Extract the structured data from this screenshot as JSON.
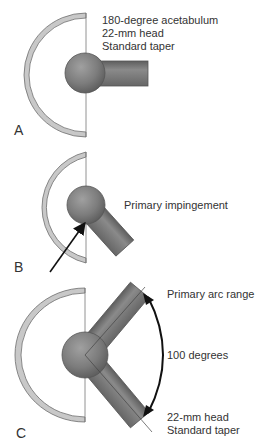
{
  "panels": [
    {
      "letter": "A",
      "labels": [
        "180-degree acetabulum",
        "22-mm head",
        "Standard taper"
      ]
    },
    {
      "letter": "B",
      "labels": [
        "Primary impingement"
      ]
    },
    {
      "letter": "C",
      "labels": [
        "Primary arc range",
        "100 degrees",
        "22-mm head",
        "Standard taper"
      ]
    }
  ],
  "colors": {
    "cup_fill": "#c8c8c8",
    "cup_stroke": "#6e6e6e",
    "ball": "#7a7a7a",
    "stem": "#777777",
    "text": "#333333"
  }
}
